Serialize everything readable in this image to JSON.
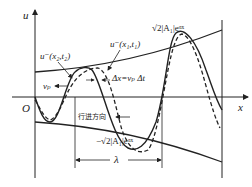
{
  "diagram": {
    "type": "wave-propagation",
    "axes": {
      "y_label": "u",
      "x_label": "x",
      "origin_label": "O"
    },
    "labels": {
      "wave_t2": "u⁻(x₂,t₂)",
      "wave_t1": "u⁻(x₁,t₁)",
      "upper_envelope": "√2|A₁|eᵅˣ",
      "lower_envelope": "−√2|A₁|eᵅˣ",
      "delta_x": "Δx=vₚ Δt",
      "phase_velocity": "vₚ",
      "direction": "行进方向",
      "wavelength": "λ"
    },
    "curves": [
      {
        "name": "solid-wave",
        "style": "solid",
        "time": "t1"
      },
      {
        "name": "dashed-wave",
        "style": "dashed",
        "time": "t2"
      },
      {
        "name": "upper-envelope",
        "style": "solid"
      },
      {
        "name": "lower-envelope",
        "style": "solid"
      }
    ]
  }
}
